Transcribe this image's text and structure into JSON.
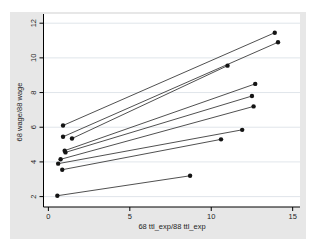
{
  "chart_data": {
    "type": "line",
    "variant": "paired-coordinate-segments",
    "title": "",
    "xlabel": "68 ttl_exp/88 ttl_exp",
    "ylabel": "68 wage/88 wage",
    "xticks": [
      0,
      5,
      10,
      15
    ],
    "yticks": [
      2,
      4,
      6,
      8,
      10,
      12
    ],
    "xlim": [
      -0.3,
      15.45
    ],
    "ylim": [
      1.4,
      12.53
    ],
    "grid": "horizontal",
    "legend": "none",
    "series": [
      {
        "name": "pair-1",
        "x": [
          0.9,
          13.9
        ],
        "y": [
          6.1,
          11.45
        ]
      },
      {
        "name": "pair-2",
        "x": [
          0.9,
          14.1
        ],
        "y": [
          5.45,
          10.9
        ]
      },
      {
        "name": "pair-3",
        "x": [
          1.45,
          11.0
        ],
        "y": [
          5.35,
          9.55
        ]
      },
      {
        "name": "pair-4",
        "x": [
          1.0,
          12.7
        ],
        "y": [
          4.65,
          8.5
        ]
      },
      {
        "name": "pair-5",
        "x": [
          1.05,
          12.5
        ],
        "y": [
          4.55,
          7.8
        ]
      },
      {
        "name": "pair-6",
        "x": [
          0.75,
          12.6
        ],
        "y": [
          4.15,
          7.2
        ]
      },
      {
        "name": "pair-7",
        "x": [
          0.6,
          11.9
        ],
        "y": [
          3.9,
          5.85
        ]
      },
      {
        "name": "pair-8",
        "x": [
          0.85,
          10.6
        ],
        "y": [
          3.55,
          5.3
        ]
      },
      {
        "name": "pair-9",
        "x": [
          0.55,
          8.7
        ],
        "y": [
          2.05,
          3.2
        ]
      }
    ],
    "colors": {
      "figure_bg": "#e7e7e7",
      "plot_bg": "#ffffff",
      "grid": "#dde2e8",
      "axis": "#000000",
      "line": "#3c3c3c",
      "marker": "#141414",
      "text": "#1f1f1f"
    }
  }
}
